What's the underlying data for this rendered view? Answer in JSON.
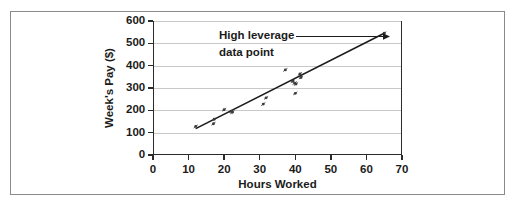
{
  "figure": {
    "background_color": "#ffffff",
    "frame_color": "#8a8a8a",
    "axis_color": "#2b2b2b",
    "grid_color": "#c9c9c9",
    "marker_color": "#3c3c3c",
    "line_color": "#1b1b1b"
  },
  "annotation": {
    "line1": "High leverage",
    "line2": "data point"
  },
  "chart_data": {
    "type": "scatter",
    "title": "",
    "xlabel": "Hours Worked",
    "ylabel": "Week's Pay ($)",
    "xlim": [
      0,
      70
    ],
    "ylim": [
      0,
      600
    ],
    "xticks": [
      0,
      10,
      20,
      30,
      40,
      50,
      60,
      70
    ],
    "yticks": [
      0,
      100,
      200,
      300,
      400,
      500,
      600
    ],
    "xtick_labels": [
      "0",
      "10",
      "20",
      "30",
      "40",
      "50",
      "60",
      "70"
    ],
    "ytick_labels": [
      "0",
      "100",
      "200",
      "300",
      "400",
      "500",
      "600"
    ],
    "grid": "horizontal",
    "legend": "none",
    "points": [
      {
        "x": 12.0,
        "y": 128
      },
      {
        "x": 17.0,
        "y": 140
      },
      {
        "x": 17.2,
        "y": 160
      },
      {
        "x": 20.0,
        "y": 203
      },
      {
        "x": 22.0,
        "y": 196
      },
      {
        "x": 22.3,
        "y": 191
      },
      {
        "x": 31.0,
        "y": 228
      },
      {
        "x": 31.8,
        "y": 256
      },
      {
        "x": 37.2,
        "y": 381
      },
      {
        "x": 39.3,
        "y": 330
      },
      {
        "x": 39.8,
        "y": 322
      },
      {
        "x": 40.2,
        "y": 318
      },
      {
        "x": 40.0,
        "y": 276
      },
      {
        "x": 41.3,
        "y": 363
      },
      {
        "x": 41.6,
        "y": 347
      },
      {
        "x": 65.0,
        "y": 545
      }
    ],
    "trend_line": {
      "label": "regression line",
      "x_start": 12.0,
      "y_start": 118,
      "x_end": 65.0,
      "y_end": 545
    },
    "annotations": [
      {
        "text": "High leverage data point",
        "target_x": 65.0,
        "target_y": 545,
        "arrow": true
      }
    ]
  }
}
